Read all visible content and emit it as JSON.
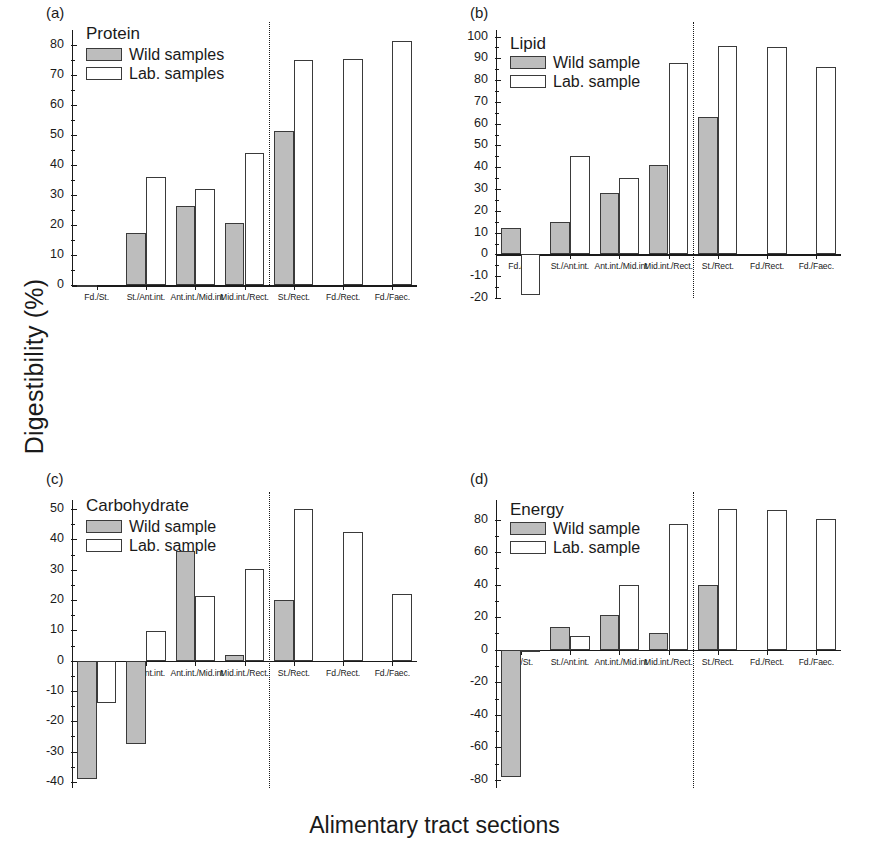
{
  "figure": {
    "ylabel": "Digestibility (%)",
    "xlabel": "Alimentary tract sections",
    "wild_color": "#bdbdbd",
    "lab_color": "#ffffff",
    "border_color": "#3a3a3a"
  },
  "panels": [
    {
      "tag": "(a)",
      "title": "Protein",
      "legend": {
        "wild": "Wild samples",
        "lab": "Lab. samples"
      }
    },
    {
      "tag": "(b)",
      "title": "Lipid",
      "legend": {
        "wild": "Wild sample",
        "lab": "Lab. sample"
      }
    },
    {
      "tag": "(c)",
      "title": "Carbohydrate",
      "legend": {
        "wild": "Wild sample",
        "lab": "Lab. sample"
      }
    },
    {
      "tag": "(d)",
      "title": "Energy",
      "legend": {
        "wild": "Wild sample",
        "lab": "Lab. sample"
      }
    }
  ],
  "chart_data": [
    {
      "type": "bar",
      "panel": "(a)",
      "title": "Protein",
      "xlabel": "Alimentary tract sections",
      "ylabel": "Digestibility (%)",
      "ylim": [
        0,
        85
      ],
      "yticks": [
        0,
        10,
        20,
        30,
        40,
        50,
        60,
        70,
        80
      ],
      "grid": false,
      "legend_position": "top-left",
      "categories": [
        "Fd./St.",
        "St./Ant.int.",
        "Ant.int./Mid.int",
        "Mid.int./Rect.",
        "St./Rect.",
        "Fd./Rect.",
        "Fd./Faec."
      ],
      "series": [
        {
          "name": "Wild samples",
          "values": [
            -0.6,
            17.3,
            26.2,
            20.6,
            51.4,
            null,
            null
          ]
        },
        {
          "name": "Lab. samples",
          "values": [
            null,
            36.0,
            32.1,
            44.1,
            75.1,
            75.2,
            81.3
          ]
        }
      ],
      "divider_after_category_index": 3
    },
    {
      "type": "bar",
      "panel": "(b)",
      "title": "Lipid",
      "xlabel": "Alimentary tract sections",
      "ylabel": "Digestibility (%)",
      "ylim": [
        -20,
        103
      ],
      "yticks": [
        -20,
        -10,
        0,
        10,
        20,
        30,
        40,
        50,
        60,
        70,
        80,
        90,
        100
      ],
      "grid": false,
      "legend_position": "top-left",
      "categories": [
        "Fd./St.",
        "St./Ant.int.",
        "Ant.int./Mid.int",
        "Mid.int./Rect.",
        "St./Rect.",
        "Fd./Rect.",
        "Fd./Faec."
      ],
      "series": [
        {
          "name": "Wild sample",
          "values": [
            12.0,
            14.8,
            28.0,
            41.0,
            63.3,
            null,
            null
          ]
        },
        {
          "name": "Lab. sample",
          "values": [
            -18.5,
            45.2,
            35.0,
            88.0,
            95.8,
            95.1,
            86.0
          ]
        }
      ],
      "divider_after_category_index": 3
    },
    {
      "type": "bar",
      "panel": "(c)",
      "title": "Carbohydrate",
      "xlabel": "Alimentary tract sections",
      "ylabel": "Digestibility (%)",
      "ylim": [
        -42,
        53
      ],
      "yticks": [
        -40,
        -30,
        -20,
        -10,
        0,
        10,
        20,
        30,
        40,
        50
      ],
      "grid": false,
      "legend_position": "top-left",
      "categories": [
        "Fd./St.",
        "St./Ant.int.",
        "Ant.int./Mid.int",
        "Mid.int./Rect.",
        "St./Rect.",
        "Fd./Rect.",
        "Fd./Faec."
      ],
      "series": [
        {
          "name": "Wild sample",
          "values": [
            -39.0,
            -27.5,
            36.2,
            1.9,
            20.1,
            null,
            null
          ]
        },
        {
          "name": "Lab. sample",
          "values": [
            -13.9,
            9.8,
            21.3,
            30.1,
            50.1,
            42.6,
            21.9
          ]
        }
      ],
      "divider_after_category_index": 3
    },
    {
      "type": "bar",
      "panel": "(d)",
      "title": "Energy",
      "xlabel": "Alimentary tract sections",
      "ylabel": "Digestibility (%)",
      "ylim": [
        -85,
        92
      ],
      "yticks": [
        -80,
        -60,
        -40,
        -20,
        0,
        20,
        40,
        60,
        80
      ],
      "grid": false,
      "legend_position": "top-left",
      "categories": [
        "Fd./St.",
        "St./Ant.int.",
        "Ant.int./Mid.int",
        "Mid.int./Rect.",
        "St./Rect.",
        "Fd./Rect.",
        "Fd./Faec."
      ],
      "series": [
        {
          "name": "Wild sample",
          "values": [
            -78.0,
            14.0,
            21.3,
            10.5,
            39.5,
            null,
            null
          ]
        },
        {
          "name": "Lab. sample",
          "values": [
            -1.5,
            8.7,
            39.8,
            77.3,
            86.2,
            86.0,
            80.5
          ]
        }
      ],
      "divider_after_category_index": 3
    }
  ]
}
